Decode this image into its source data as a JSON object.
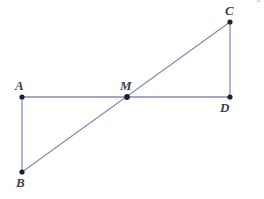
{
  "figure": {
    "canvas": {
      "width": 264,
      "height": 199,
      "background": "#ffffff"
    },
    "style": {
      "line_color": "#8490b4",
      "line_width": 1.3,
      "point_color": "#1d2430",
      "point_radius": 2.6,
      "label_color": "#3a3f4a",
      "credit_color": "#b6b6b6"
    },
    "points": [
      {
        "id": "A",
        "label": "A",
        "x": 22,
        "y": 97,
        "label_dx": -7,
        "label_dy": -18
      },
      {
        "id": "B",
        "label": "B",
        "x": 22,
        "y": 172,
        "label_dx": -6,
        "label_dy": 4
      },
      {
        "id": "C",
        "label": "C",
        "x": 230,
        "y": 22,
        "label_dx": -5,
        "label_dy": -18
      },
      {
        "id": "D",
        "label": "D",
        "x": 230,
        "y": 97,
        "label_dx": -10,
        "label_dy": 4
      },
      {
        "id": "M",
        "label": "M",
        "x": 127,
        "y": 97,
        "label_dx": -7,
        "label_dy": -18
      }
    ],
    "segments": [
      {
        "id": "AD",
        "from": "A",
        "to": "D",
        "name": "segment-AD"
      },
      {
        "id": "AB",
        "from": "A",
        "to": "B",
        "name": "segment-AB"
      },
      {
        "id": "CD",
        "from": "C",
        "to": "D",
        "name": "segment-CD"
      },
      {
        "id": "BC",
        "from": "B",
        "to": "C",
        "name": "segment-BC"
      }
    ]
  },
  "credit": {
    "text": "Banco de imagens/Arquivo da editora"
  }
}
